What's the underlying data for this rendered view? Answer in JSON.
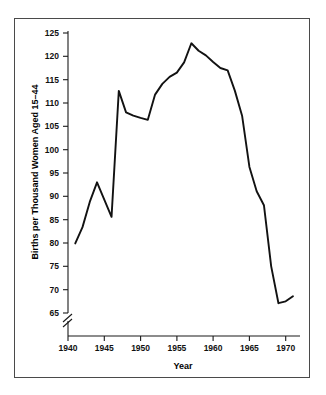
{
  "chart_data": {
    "type": "line",
    "title": "",
    "subtitle": "",
    "xlabel": "Year",
    "ylabel": "Births per Thousand Women Aged 15–44",
    "xlim": [
      1940,
      1972
    ],
    "ylim": [
      65,
      125
    ],
    "y_axis_break": true,
    "y_axis_break_symbol": "//",
    "grid": false,
    "legend": null,
    "legend_position": "none",
    "line_color": "#121212",
    "xticks": [
      1940,
      1945,
      1950,
      1955,
      1960,
      1965,
      1970
    ],
    "xtick_labels": [
      "1940",
      "1945",
      "1950",
      "1955",
      "1960",
      "1965",
      "1970"
    ],
    "yticks": [
      65,
      70,
      75,
      80,
      85,
      90,
      95,
      100,
      105,
      110,
      115,
      120,
      125
    ],
    "ytick_labels": [
      "65",
      "70",
      "75",
      "80",
      "85",
      "90",
      "95",
      "100",
      "105",
      "110",
      "115",
      "120",
      "125"
    ],
    "series": [
      {
        "name": "Births per Thousand Women Aged 15-44",
        "x": [
          1941,
          1942,
          1943,
          1944,
          1945,
          1946,
          1947,
          1948,
          1949,
          1950,
          1951,
          1952,
          1953,
          1954,
          1955,
          1956,
          1957,
          1958,
          1959,
          1960,
          1961,
          1962,
          1963,
          1964,
          1965,
          1966,
          1967,
          1968,
          1969,
          1970,
          1971
        ],
        "values": [
          79.9,
          83.4,
          88.8,
          93.0,
          89.3,
          85.6,
          112.6,
          108.0,
          107.3,
          106.8,
          106.4,
          111.8,
          114.1,
          115.6,
          116.5,
          118.7,
          122.8,
          121.2,
          120.2,
          118.8,
          117.5,
          117.0,
          112.6,
          107.2,
          96.3,
          91.1,
          88.1,
          75.0,
          67.1,
          67.5,
          68.6
        ]
      }
    ]
  },
  "chart": {
    "xlabel": "Year",
    "ylabel": "Births per Thousand Women Aged 15–44"
  }
}
